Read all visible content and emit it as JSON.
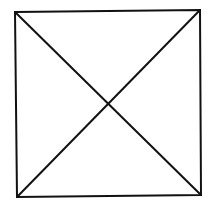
{
  "diagram": {
    "stroke_color": "#111111",
    "background_color": "#ffffff",
    "square": {
      "corners": {
        "top_left": [
          15,
          12
        ],
        "top_right": [
          200,
          10
        ],
        "bottom_right": [
          201,
          195
        ],
        "bottom_left": [
          17,
          197
        ]
      }
    },
    "diagonals": [
      {
        "from": "top_left",
        "to": "bottom_right"
      },
      {
        "from": "top_right",
        "to": "bottom_left"
      }
    ],
    "intersection": [
      107,
      103
    ]
  }
}
